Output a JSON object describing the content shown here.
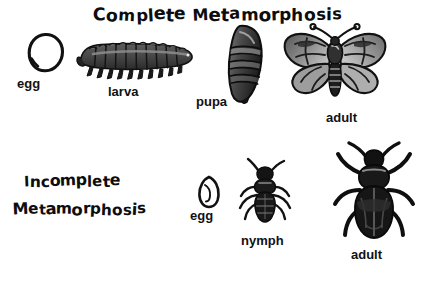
{
  "diagram": {
    "title_top": "Complete Metamorphosis",
    "title_bottom_line1": "Incomplete",
    "title_bottom_line2": "Metamorphosis",
    "background_color": "#ffffff",
    "ink_color": "#111111"
  },
  "complete_stages": [
    {
      "label": "egg",
      "art": "egg-circle-outline"
    },
    {
      "label": "larva",
      "art": "caterpillar"
    },
    {
      "label": "pupa",
      "art": "chrysalis"
    },
    {
      "label": "adult",
      "art": "moth"
    }
  ],
  "incomplete_stages": [
    {
      "label": "egg",
      "art": "egg-oval-outline"
    },
    {
      "label": "nymph",
      "art": "nymph-bug"
    },
    {
      "label": "adult",
      "art": "adult-bug"
    }
  ],
  "bottom_cut_text": "",
  "palette": {
    "black": "#111111",
    "dark_gray": "#3f3f3f",
    "mid_gray": "#6e6e6e",
    "light_gray": "#a8a8a8",
    "pale_gray": "#c9c9c9"
  }
}
